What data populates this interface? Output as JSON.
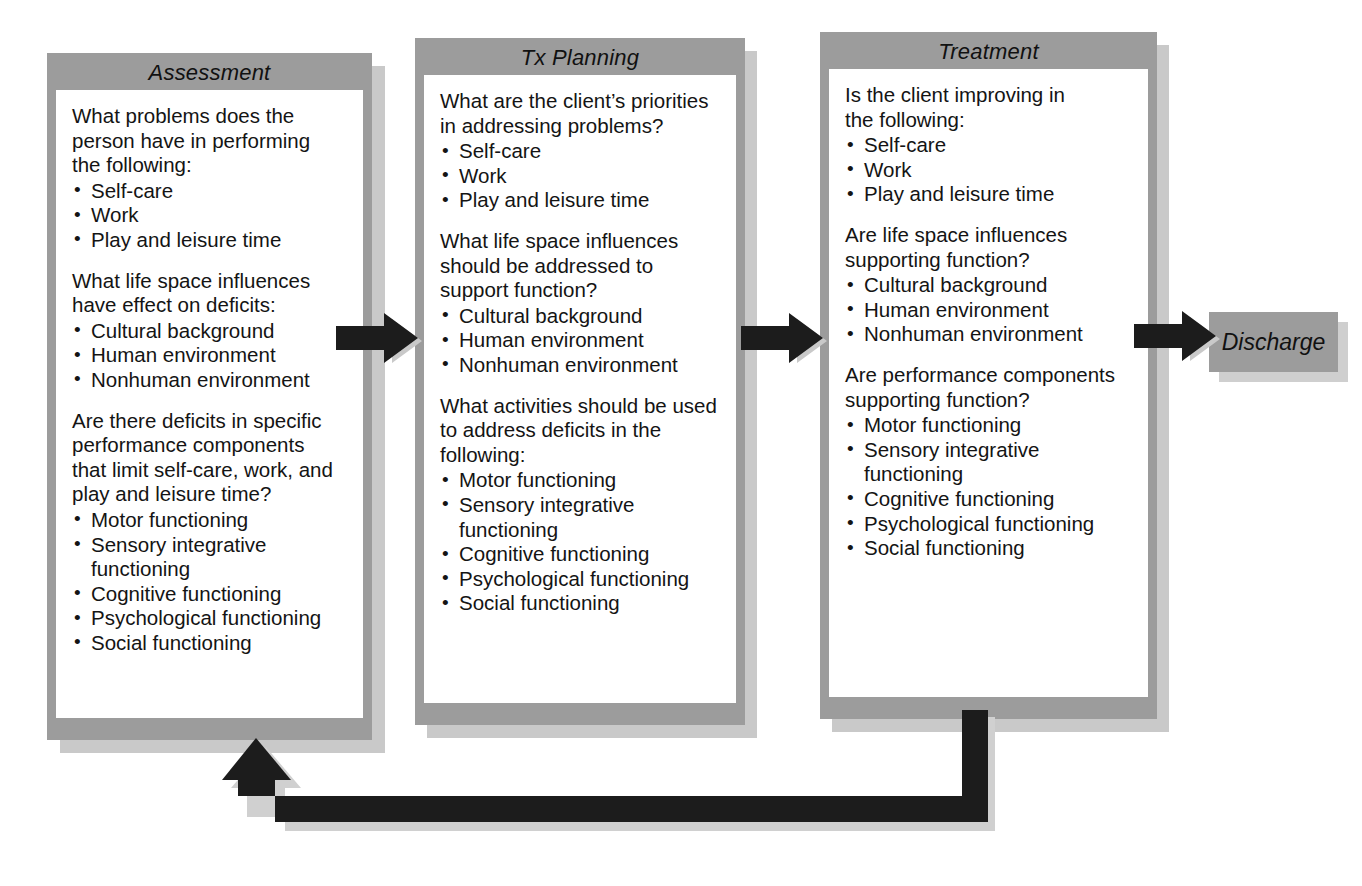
{
  "diagram": {
    "colors": {
      "frame_gray": "#9c9c9c",
      "shadow_gray": "#c9c9c9",
      "arrow_black": "#1c1c1c",
      "box_white": "#ffffff",
      "text_black": "#141414"
    },
    "stages": [
      {
        "id": "assessment",
        "title": "Assessment",
        "blocks": [
          {
            "question": "What problems does the\nperson have in performing\nthe following:",
            "items": [
              "Self-care",
              "Work",
              "Play and leisure time"
            ]
          },
          {
            "question": "What life space influences\nhave effect on deficits:",
            "items": [
              "Cultural background",
              "Human environment",
              "Nonhuman environment"
            ]
          },
          {
            "question": "Are there deficits in specific\nperformance components\nthat limit self-care, work, and\nplay and leisure time?",
            "items": [
              "Motor functioning",
              "Sensory integrative\nfunctioning",
              "Cognitive functioning",
              "Psychological functioning",
              "Social functioning"
            ]
          }
        ]
      },
      {
        "id": "tx-planning",
        "title": "Tx Planning",
        "blocks": [
          {
            "question": "What are the client’s priorities\nin addressing problems?",
            "items": [
              "Self-care",
              "Work",
              "Play and leisure time"
            ]
          },
          {
            "question": "What life space influences\nshould be addressed to\nsupport function?",
            "items": [
              "Cultural background",
              "Human environment",
              "Nonhuman environment"
            ]
          },
          {
            "question": "What activities should be used\nto address deficits in the\nfollowing:",
            "items": [
              "Motor functioning",
              "Sensory integrative\nfunctioning",
              "Cognitive functioning",
              "Psychological functioning",
              "Social functioning"
            ]
          }
        ]
      },
      {
        "id": "treatment",
        "title": "Treatment",
        "blocks": [
          {
            "question": "Is the client improving in\nthe following:",
            "items": [
              "Self-care",
              "Work",
              "Play and leisure time"
            ]
          },
          {
            "question": "Are life space influences\nsupporting function?",
            "items": [
              "Cultural background",
              "Human environment",
              "Nonhuman environment"
            ]
          },
          {
            "question": "Are performance components\nsupporting function?",
            "items": [
              "Motor functioning",
              "Sensory integrative\nfunctioning",
              "Cognitive functioning",
              "Psychological functioning",
              "Social functioning"
            ]
          }
        ]
      }
    ],
    "discharge": {
      "label": "Discharge"
    },
    "connectors": [
      {
        "id": "assessment-to-tx",
        "kind": "right-arrow"
      },
      {
        "id": "tx-to-treatment",
        "kind": "right-arrow"
      },
      {
        "id": "treatment-to-discharge",
        "kind": "right-arrow"
      },
      {
        "id": "treatment-back-to-assessment",
        "kind": "feedback-loop-up-arrow"
      }
    ]
  }
}
